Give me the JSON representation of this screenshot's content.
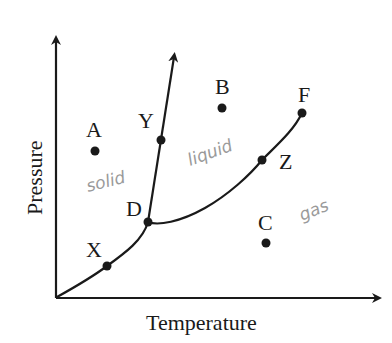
{
  "diagram": {
    "type": "phase-diagram",
    "axes": {
      "x_label": "Temperature",
      "y_label": "Pressure"
    },
    "points": [
      {
        "id": "A",
        "label": "A",
        "x": 95,
        "y": 151,
        "lx": 86,
        "ly": 137
      },
      {
        "id": "B",
        "label": "B",
        "x": 222,
        "y": 108,
        "lx": 215,
        "ly": 94
      },
      {
        "id": "C",
        "label": "C",
        "x": 266,
        "y": 243,
        "lx": 258,
        "ly": 230
      },
      {
        "id": "D",
        "label": "D",
        "x": 148,
        "y": 222,
        "lx": 126,
        "ly": 216
      },
      {
        "id": "F",
        "label": "F",
        "x": 302,
        "y": 113,
        "lx": 298,
        "ly": 102
      },
      {
        "id": "X",
        "label": "X",
        "x": 107,
        "y": 266,
        "lx": 86,
        "ly": 257
      },
      {
        "id": "Y",
        "label": "Y",
        "x": 161,
        "y": 140,
        "lx": 138,
        "ly": 128
      },
      {
        "id": "Z",
        "label": "Z",
        "x": 262,
        "y": 160,
        "lx": 279,
        "ly": 169
      }
    ],
    "region_annotations": {
      "solid": "solid",
      "liquid": "liquid",
      "gas": "gas"
    },
    "colors": {
      "ink": "#1a1a1a",
      "handwriting": "#9a9a9a",
      "background": "#ffffff"
    }
  }
}
